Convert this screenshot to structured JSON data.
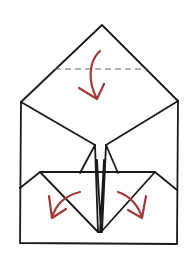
{
  "diagram": {
    "type": "origami-fold-step",
    "colors": {
      "line": "#1a1a1a",
      "arrow": "#a33a3a",
      "fold_line": "#666666",
      "background": "#ffffff"
    },
    "elements": [
      {
        "name": "top-flap-triangle",
        "description": "triangular top flap with apex"
      },
      {
        "name": "valley-fold-line",
        "description": "dashed horizontal fold line across top flap"
      },
      {
        "name": "fold-down-arrow",
        "description": "curved arrow folding top point down"
      },
      {
        "name": "body-rectangle",
        "description": "rectangular base of the model"
      },
      {
        "name": "center-flaps",
        "description": "narrow vertical flaps at center"
      },
      {
        "name": "bottom-triangle-flaps",
        "description": "two lower triangular flaps meeting at bottom center"
      },
      {
        "name": "fold-left-arrow",
        "description": "curved arrow folding left flap outward"
      },
      {
        "name": "fold-right-arrow",
        "description": "curved arrow folding right flap outward"
      }
    ]
  }
}
